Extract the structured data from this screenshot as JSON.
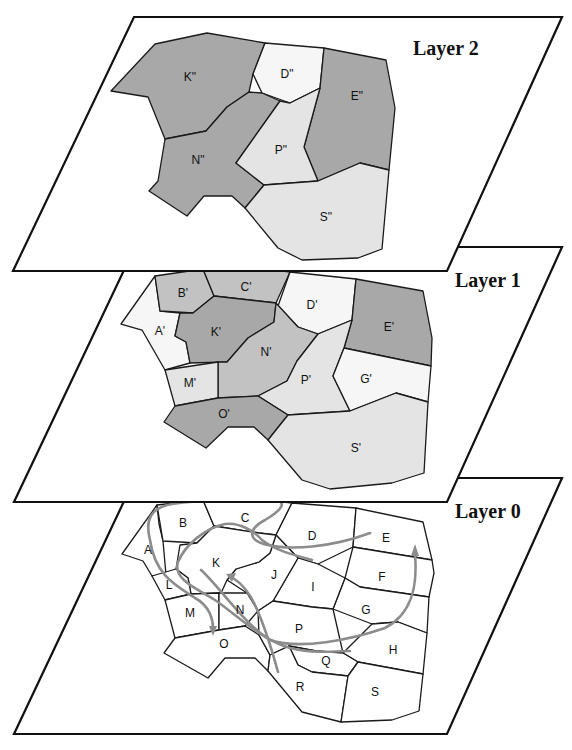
{
  "figure": {
    "colors": {
      "dark": "#a8a8a8",
      "medium": "#c2c2c2",
      "light": "#e4e4e4",
      "pale": "#f6f6f6",
      "none": "#ffffff",
      "trajectory": "#8c8c8c"
    },
    "layers": [
      {
        "title": "Layer 2",
        "cells": [
          {
            "label": "K\"",
            "shade": "dark"
          },
          {
            "label": "D\"",
            "shade": "pale"
          },
          {
            "label": "E\"",
            "shade": "dark"
          },
          {
            "label": "N\"",
            "shade": "dark"
          },
          {
            "label": "P\"",
            "shade": "light"
          },
          {
            "label": "S\"",
            "shade": "light"
          }
        ]
      },
      {
        "title": "Layer 1",
        "cells": [
          {
            "label": "B'",
            "shade": "medium"
          },
          {
            "label": "C'",
            "shade": "medium"
          },
          {
            "label": "D'",
            "shade": "pale"
          },
          {
            "label": "E'",
            "shade": "dark"
          },
          {
            "label": "A'",
            "shade": "pale"
          },
          {
            "label": "K'",
            "shade": "dark"
          },
          {
            "label": "N'",
            "shade": "medium"
          },
          {
            "label": "M'",
            "shade": "light"
          },
          {
            "label": "P'",
            "shade": "light"
          },
          {
            "label": "G'",
            "shade": "pale"
          },
          {
            "label": "O'",
            "shade": "dark"
          },
          {
            "label": "S'",
            "shade": "light"
          }
        ]
      },
      {
        "title": "Layer 0",
        "cells": [
          {
            "label": "A"
          },
          {
            "label": "B"
          },
          {
            "label": "C"
          },
          {
            "label": "D"
          },
          {
            "label": "E"
          },
          {
            "label": "F"
          },
          {
            "label": "G"
          },
          {
            "label": "H"
          },
          {
            "label": "I"
          },
          {
            "label": "J"
          },
          {
            "label": "K"
          },
          {
            "label": "L"
          },
          {
            "label": "M"
          },
          {
            "label": "N"
          },
          {
            "label": "O"
          },
          {
            "label": "P"
          },
          {
            "label": "Q"
          },
          {
            "label": "R"
          },
          {
            "label": "S"
          }
        ],
        "trajectories": [
          {
            "name": "trajectory-1",
            "has_arrow": true
          },
          {
            "name": "trajectory-2",
            "has_arrow": true
          },
          {
            "name": "trajectory-3",
            "has_arrow": true
          },
          {
            "name": "trajectory-4",
            "has_arrow": false
          }
        ]
      }
    ]
  }
}
